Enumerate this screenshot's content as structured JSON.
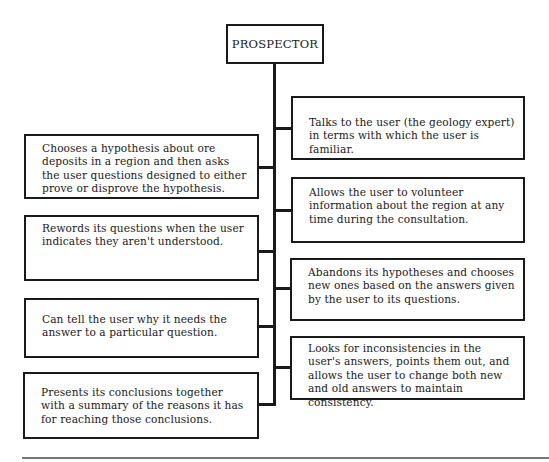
{
  "diagram": {
    "root": {
      "label": "PROSPECTOR"
    },
    "left_items": [
      {
        "text": "Chooses a hypothesis about ore deposits in a region and then asks the user questions designed to either prove or disprove the hypothesis."
      },
      {
        "text": "Rewords its questions when the user indicates they aren't understood."
      },
      {
        "text": "Can tell the user why it needs the answer to a particular question."
      },
      {
        "text": "Presents its conclusions together with a summary of the reasons it has for reaching those conclusions."
      }
    ],
    "right_items": [
      {
        "text": "Talks to the user (the geology expert) in terms with which the user is familiar."
      },
      {
        "text": "Allows the user to volunteer information about the region at any time during the consultation."
      },
      {
        "text": "Abandons its hypotheses and chooses new ones based on the answers given by the user to its questions."
      },
      {
        "text": "Looks for inconsistencies in the user's answers, points them out, and allows the user to change both new and old answers to maintain consistency."
      }
    ]
  }
}
